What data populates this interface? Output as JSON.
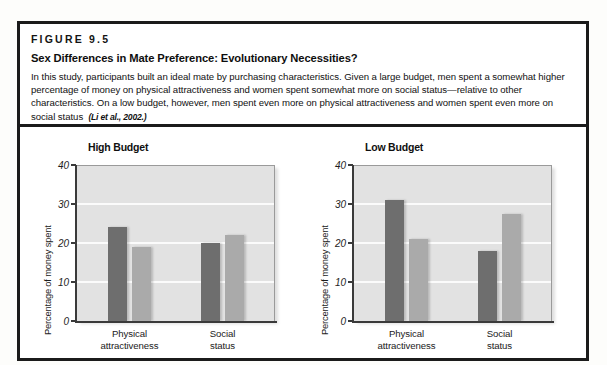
{
  "figure": {
    "number": "FIGURE 9.5",
    "title": "Sex Differences in Mate Preference: Evolutionary Necessities?",
    "description": "In this study, participants built an ideal mate by purchasing characteristics. Given a large budget, men spent a somewhat higher percentage of money on physical attractiveness and women spent somewhat more on social status—relative to other characteristics. On a low budget, however, men spent even more on physical attractiveness and women spent even more on social status",
    "citation": "(Li et al., 2002.)"
  },
  "chart_data": [
    {
      "type": "bar",
      "title": "High Budget",
      "xlabel": "",
      "ylabel": "Percentage of money spent",
      "categories": [
        "Physical attractiveness",
        "Social status"
      ],
      "category_lines": [
        [
          "Physical",
          "attractiveness"
        ],
        [
          "Social",
          "status"
        ]
      ],
      "series": [
        {
          "name": "Men",
          "values": [
            24,
            20
          ],
          "color": "#6e6e6e"
        },
        {
          "name": "Women",
          "values": [
            19,
            22
          ],
          "color": "#aaaaaa"
        }
      ],
      "ylim": [
        0,
        40
      ],
      "yticks": [
        40,
        30,
        20,
        10,
        0
      ],
      "grid": true,
      "legend": "none"
    },
    {
      "type": "bar",
      "title": "Low Budget",
      "xlabel": "",
      "ylabel": "Percentage of money spent",
      "categories": [
        "Physical attractiveness",
        "Social status"
      ],
      "category_lines": [
        [
          "Physical",
          "attractiveness"
        ],
        [
          "Social",
          "status"
        ]
      ],
      "series": [
        {
          "name": "Men",
          "values": [
            31,
            18
          ],
          "color": "#6e6e6e"
        },
        {
          "name": "Women",
          "values": [
            21,
            27.5
          ],
          "color": "#aaaaaa"
        }
      ],
      "ylim": [
        0,
        40
      ],
      "yticks": [
        40,
        30,
        20,
        10,
        0
      ],
      "grid": true,
      "legend": "none"
    }
  ],
  "colors": {
    "frame": "#1b1b1b",
    "plot_background": "#e2e2e2",
    "gridline": "#fbfbfb",
    "men_bar": "#6e6e6e",
    "women_bar": "#aaaaaa"
  }
}
